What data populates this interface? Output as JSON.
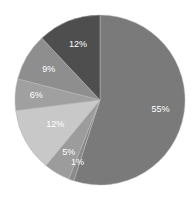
{
  "chart_data": {
    "type": "pie",
    "title": "",
    "start_angle_deg": 0,
    "direction": "clockwise",
    "categories": [
      "Slice 1",
      "Slice 2",
      "Slice 3",
      "Slice 4",
      "Slice 5",
      "Slice 6",
      "Slice 7"
    ],
    "values": [
      55,
      1,
      5,
      12,
      6,
      9,
      12
    ],
    "labels": [
      "55%",
      "1%",
      "5%",
      "12%",
      "6%",
      "9%",
      "12%"
    ],
    "colors": [
      "#7a7a7a",
      "#8a8a8a",
      "#9c9c9c",
      "#c8c8c8",
      "#a0a0a0",
      "#8e8e8e",
      "#4e4e4e"
    ],
    "label_radius_ratio": [
      0.72,
      0.78,
      0.72,
      0.6,
      0.75,
      0.7,
      0.7
    ],
    "legend": "none"
  }
}
